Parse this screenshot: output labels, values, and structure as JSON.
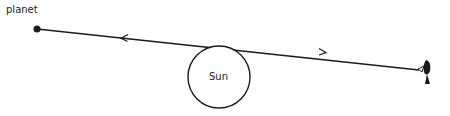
{
  "diagram": {
    "labels": {
      "planet": "planet",
      "sun": "Sun"
    },
    "elements": {
      "planet": {
        "x": 37,
        "y": 29
      },
      "sun": {
        "cx": 219,
        "cy": 77,
        "r": 31
      },
      "observer": {
        "x": 425,
        "y": 72
      },
      "sightline": {
        "x1": 37,
        "y1": 29,
        "x2": 419,
        "y2": 70
      }
    },
    "colors": {
      "stroke": "#1a1a1a",
      "background": "#ffffff"
    }
  }
}
